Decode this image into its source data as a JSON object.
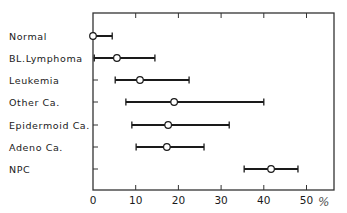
{
  "chart_data": {
    "type": "errorbar",
    "title": "",
    "xlabel": "%",
    "ylabel": "",
    "xlim": [
      0,
      56
    ],
    "xticks": [
      0,
      10,
      20,
      30,
      40,
      50
    ],
    "xtick_labels": [
      "0",
      "10",
      "20",
      "30",
      "40",
      "50"
    ],
    "unit_label": "%",
    "grid": false,
    "legend": null,
    "categories": [
      "Normal",
      "BL.Lymphoma",
      "Leukemia",
      "Other Ca.",
      "Epidermoid Ca.",
      "Adeno Ca.",
      "NPC"
    ],
    "series": [
      {
        "name": "range",
        "points": [
          {
            "label": "Normal",
            "low": 0,
            "mean": 0,
            "high": 4.5
          },
          {
            "label": "BL.Lymphoma",
            "low": 0.3,
            "mean": 5.6,
            "high": 14.5
          },
          {
            "label": "Leukemia",
            "low": 5.2,
            "mean": 11.0,
            "high": 22.5
          },
          {
            "label": "Other Ca.",
            "low": 7.7,
            "mean": 19.0,
            "high": 40.0
          },
          {
            "label": "Epidermoid Ca.",
            "low": 9.1,
            "mean": 17.6,
            "high": 31.9
          },
          {
            "label": "Adeno Ca.",
            "low": 10.1,
            "mean": 17.3,
            "high": 26.0
          },
          {
            "label": "NPC",
            "low": 35.4,
            "mean": 41.7,
            "high": 48.0
          }
        ]
      }
    ],
    "colors": {
      "line": "#1a1a1a",
      "marker_fill": "#ffffff",
      "frame": "#333333"
    }
  }
}
